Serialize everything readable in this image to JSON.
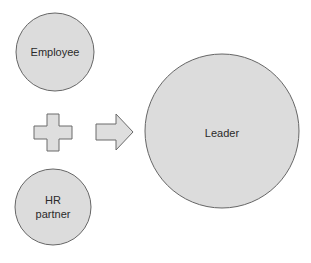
{
  "diagram": {
    "nodes": [
      {
        "id": "employee",
        "label": "Employee",
        "cx": 55,
        "cy": 52,
        "r": 39
      },
      {
        "id": "hr-partner",
        "label_lines": [
          "HR",
          "partner"
        ],
        "cx": 53,
        "cy": 207,
        "r": 38
      },
      {
        "id": "leader",
        "label": "Leader",
        "cx": 222,
        "cy": 131,
        "r": 77
      }
    ],
    "operators": {
      "plus": "plus-sign",
      "arrow": "right-arrow"
    },
    "colors": {
      "fill": "#dcdcdc",
      "stroke": "#666666",
      "text": "#2a2a2a"
    }
  }
}
